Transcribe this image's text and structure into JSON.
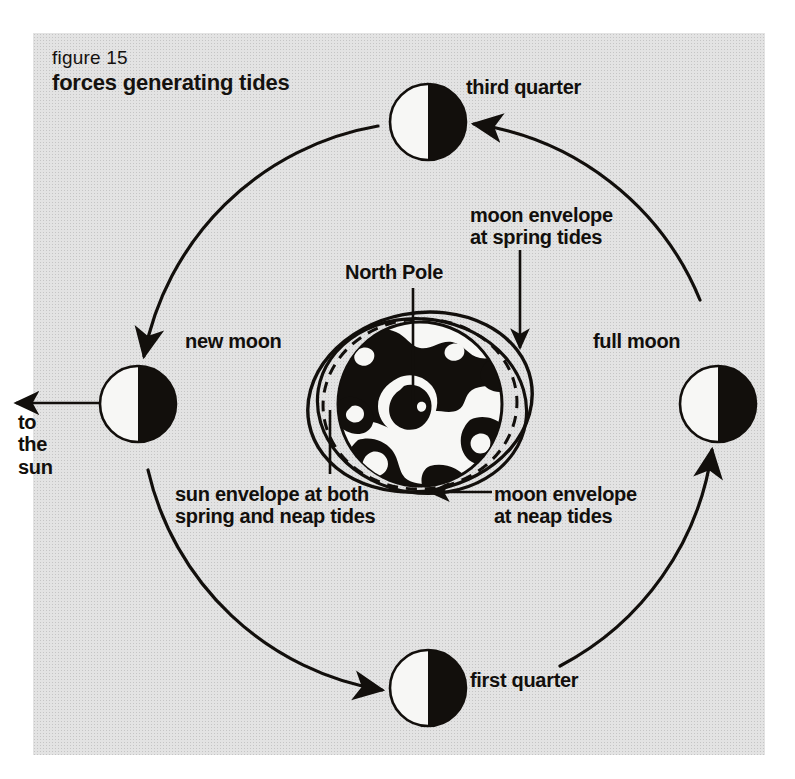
{
  "figure": {
    "number_label": "figure 15",
    "title": "forces generating tides",
    "panel_color": "#e3e3e3",
    "ink_color": "#120f0c"
  },
  "labels": {
    "third_quarter": "third quarter",
    "new_moon": "new moon",
    "full_moon": "full moon",
    "first_quarter": "first quarter",
    "to_the_sun": "to\nthe\nsun",
    "north_pole": "North Pole",
    "moon_envelope_spring": "moon envelope\nat spring tides",
    "sun_envelope_both": "sun envelope at both\nspring and neap tides",
    "moon_envelope_neap": "moon envelope\nat neap tides"
  },
  "diagram": {
    "type": "astronomical-schematic",
    "orbit": {
      "center_x": 428,
      "center_y": 404,
      "radius": 288,
      "direction": "counterclockwise",
      "segments": 4,
      "arrowheads": 4
    },
    "earth": {
      "center_x": 420,
      "center_y": 404,
      "radius": 82,
      "view": "north polar",
      "land_color": "#120f0c",
      "ocean_color": "#f7f7f5"
    },
    "envelopes": [
      {
        "name": "moon envelope at spring tides",
        "style": "solid",
        "rx": 112,
        "ry": 88,
        "rotation": -10
      },
      {
        "name": "moon envelope at neap tides",
        "style": "solid",
        "rx": 104,
        "ry": 86,
        "rotation": 8
      },
      {
        "name": "sun envelope at both spring and neap tides",
        "style": "dashed",
        "rx": 96,
        "ry": 84,
        "rotation": -4
      }
    ],
    "moons": [
      {
        "phase": "third quarter",
        "cx": 428,
        "cy": 122,
        "r": 38,
        "lit_side": "left"
      },
      {
        "phase": "new moon",
        "cx": 138,
        "cy": 404,
        "r": 38,
        "lit_side": "left"
      },
      {
        "phase": "full moon",
        "cx": 718,
        "cy": 404,
        "r": 38,
        "lit_side": "left"
      },
      {
        "phase": "first quarter",
        "cx": 428,
        "cy": 688,
        "r": 38,
        "lit_side": "left"
      }
    ],
    "sun_direction_arrow": {
      "from_x": 102,
      "from_y": 403,
      "to_x": 14,
      "to_y": 403,
      "points": "left"
    }
  }
}
